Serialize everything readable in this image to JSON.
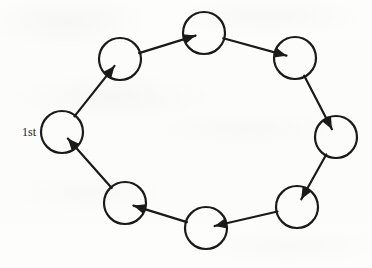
{
  "figure": {
    "background_color": "#fdfdfc",
    "stroke_color": "#1a1a1a",
    "stroke_width": 2.2,
    "node_radius": 21,
    "node_count": 8,
    "direction": "clockwise"
  },
  "labels": {
    "first": "1st"
  },
  "nodes": [
    {
      "id": "n1",
      "name": "node-1st",
      "cx": 62,
      "cy": 132,
      "label": "1st"
    },
    {
      "id": "n2",
      "name": "node-upper-left",
      "cx": 120,
      "cy": 59,
      "label": ""
    },
    {
      "id": "n3",
      "name": "node-top",
      "cx": 204,
      "cy": 33,
      "label": ""
    },
    {
      "id": "n4",
      "name": "node-upper-right",
      "cx": 295,
      "cy": 58,
      "label": ""
    },
    {
      "id": "n5",
      "name": "node-right",
      "cx": 336,
      "cy": 137,
      "label": ""
    },
    {
      "id": "n6",
      "name": "node-lower-right",
      "cx": 297,
      "cy": 207,
      "label": ""
    },
    {
      "id": "n7",
      "name": "node-bottom",
      "cx": 206,
      "cy": 228,
      "label": ""
    },
    {
      "id": "n8",
      "name": "node-lower-left",
      "cx": 125,
      "cy": 203,
      "label": ""
    }
  ],
  "edges": [
    {
      "name": "edge-1st-to-upper-left",
      "from": "n1",
      "to": "n2"
    },
    {
      "name": "edge-upper-left-to-top",
      "from": "n2",
      "to": "n3"
    },
    {
      "name": "edge-top-to-upper-right",
      "from": "n3",
      "to": "n4"
    },
    {
      "name": "edge-upper-right-to-right",
      "from": "n4",
      "to": "n5"
    },
    {
      "name": "edge-right-to-lower-right",
      "from": "n5",
      "to": "n6"
    },
    {
      "name": "edge-lower-right-to-bottom",
      "from": "n6",
      "to": "n7"
    },
    {
      "name": "edge-bottom-to-lower-left",
      "from": "n7",
      "to": "n8"
    },
    {
      "name": "edge-lower-left-to-1st",
      "from": "n8",
      "to": "n1"
    }
  ]
}
